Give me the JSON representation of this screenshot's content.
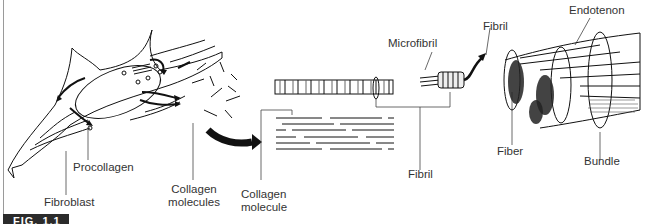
{
  "figure": {
    "label": "FIG. 1.1",
    "caption_bar_color": "#2b2b2b"
  },
  "labels": {
    "fibroblast": "Fibroblast",
    "procollagen": "Procollagen",
    "collagen_molecules_1": "Collagen",
    "collagen_molecules_2": "molecules",
    "collagen_molecule_1": "Collagen",
    "collagen_molecule_2": "molecule",
    "microfibril": "Microfibril",
    "fibril_top": "Fibril",
    "fibril_bottom": "Fibril",
    "fiber": "Fiber",
    "bundle": "Bundle",
    "endotenon": "Endotenon"
  },
  "stages": [
    "Fibroblast",
    "Procollagen",
    "Collagen molecules",
    "Collagen molecule",
    "Fibril",
    "Microfibril",
    "Fibril",
    "Fiber",
    "Bundle",
    "Endotenon"
  ]
}
